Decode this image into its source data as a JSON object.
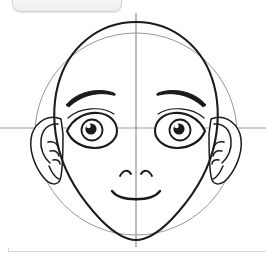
{
  "app": {
    "background_color": "#ffffff",
    "ink_color": "#1b1b1b",
    "guide_color": "#8a8a8a",
    "chip_label": ""
  },
  "chip": {
    "label": "",
    "fill": "#f1f1f1",
    "border": "#d2d2d2"
  },
  "separator": {
    "color": "#d8d8d8"
  },
  "drawing": {
    "title": "Anime face construction line drawing",
    "subject": "front-facing female head",
    "style": "black ink line art on white",
    "parts": [
      {
        "name": "guide-circle",
        "label": "Construction circle",
        "stroke": "#8a8a8a",
        "stroke_width": 0.8
      },
      {
        "name": "guide-vertical",
        "label": "Vertical center line",
        "stroke": "#8a8a8a",
        "stroke_width": 1.1
      },
      {
        "name": "guide-horizontal",
        "label": "Horizontal eye line",
        "stroke": "#8a8a8a",
        "stroke_width": 0.9
      },
      {
        "name": "head-outline",
        "label": "Head and jaw outline",
        "stroke": "#1b1b1b",
        "stroke_width": 2.0
      },
      {
        "name": "left-ear",
        "label": "Left ear",
        "stroke": "#1b1b1b",
        "stroke_width": 1.6
      },
      {
        "name": "right-ear",
        "label": "Right ear",
        "stroke": "#1b1b1b",
        "stroke_width": 1.6
      },
      {
        "name": "left-eyebrow",
        "label": "Left eyebrow",
        "stroke": "#1b1b1b",
        "stroke_width": 2.2
      },
      {
        "name": "right-eyebrow",
        "label": "Right eyebrow",
        "stroke": "#1b1b1b",
        "stroke_width": 2.2
      },
      {
        "name": "left-eye",
        "label": "Left eye",
        "stroke": "#1b1b1b",
        "stroke_width": 1.8
      },
      {
        "name": "right-eye",
        "label": "Right eye",
        "stroke": "#1b1b1b",
        "stroke_width": 1.8
      },
      {
        "name": "nose",
        "label": "Nose nostril arcs",
        "stroke": "#1b1b1b",
        "stroke_width": 1.8
      },
      {
        "name": "mouth",
        "label": "Smiling mouth",
        "stroke": "#1b1b1b",
        "stroke_width": 2.0
      }
    ],
    "geometry": {
      "guide_circle": {
        "cx": 136,
        "cy": 134,
        "r": 101
      },
      "guide_vertical": {
        "x": 136,
        "y1": 13,
        "y2": 247
      },
      "guide_horizontal": {
        "y": 128,
        "x1": 0,
        "x2": 266
      },
      "left_eye_center": {
        "x": 90,
        "y": 131
      },
      "right_eye_center": {
        "x": 179,
        "y": 131
      },
      "left_pupil": {
        "x": 92,
        "y": 130,
        "r": 5.2
      },
      "right_pupil": {
        "x": 178,
        "y": 130,
        "r": 5.2
      },
      "nose_center": {
        "x": 136,
        "y": 173
      },
      "mouth_center": {
        "x": 136,
        "y": 193
      },
      "chin": {
        "x": 136,
        "y": 239
      },
      "head_top": {
        "x": 136,
        "y": 22
      }
    }
  }
}
